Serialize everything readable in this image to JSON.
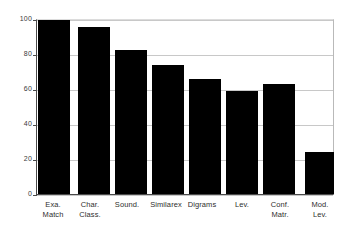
{
  "chart_data": {
    "type": "bar",
    "title": "",
    "subtitle": "",
    "xlabel": "",
    "ylabel": "",
    "ylim": [
      0,
      100
    ],
    "yticks": [
      0,
      20,
      40,
      60,
      80,
      100
    ],
    "grid": true,
    "legend": false,
    "bar_color": "#000000",
    "categories": [
      "Exa. Match",
      "Char. Class.",
      "Sound.",
      "Similarex",
      "Digrams",
      "Lev.",
      "Conf. Matr.",
      "Mod. Lev."
    ],
    "category_lines": [
      [
        "Exa.",
        "Match"
      ],
      [
        "Char.",
        "Class."
      ],
      [
        "Sound.",
        ""
      ],
      [
        "Similarex",
        ""
      ],
      [
        "Digrams",
        ""
      ],
      [
        "Lev.",
        ""
      ],
      [
        "Conf.",
        "Matr."
      ],
      [
        "Mod.",
        "Lev."
      ]
    ],
    "values": [
      100,
      96,
      83,
      74,
      66,
      59,
      63,
      24
    ]
  }
}
